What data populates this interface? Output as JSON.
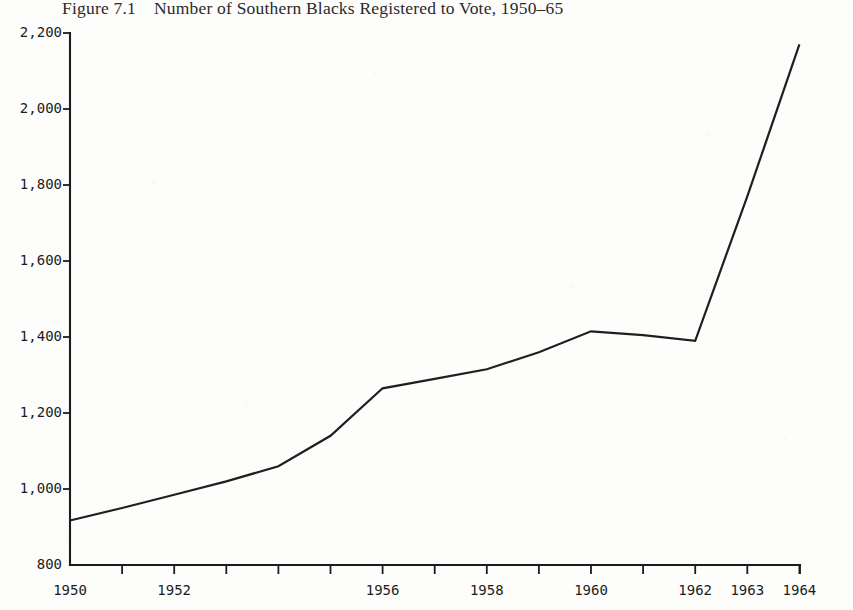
{
  "figure": {
    "number_label": "Figure 7.1",
    "caption": "Number of Southern Blacks Registered to Vote, 1950–65"
  },
  "chart_data": {
    "type": "line",
    "xlabel": "",
    "ylabel": "",
    "x": [
      1950,
      1951,
      1952,
      1953,
      1954,
      1955,
      1956,
      1957,
      1958,
      1959,
      1960,
      1961,
      1962,
      1963,
      1964
    ],
    "values": [
      917,
      950,
      985,
      1020,
      1060,
      1140,
      1265,
      1290,
      1315,
      1360,
      1415,
      1405,
      1390,
      1770,
      2170
    ],
    "series": [
      {
        "name": "Southern Blacks registered to vote (thousands)",
        "values": [
          917,
          950,
          985,
          1020,
          1060,
          1140,
          1265,
          1290,
          1315,
          1360,
          1415,
          1405,
          1390,
          1770,
          2170
        ]
      }
    ],
    "xlim": [
      1950,
      1964.85
    ],
    "ylim": [
      800,
      2200
    ],
    "ytick_values": [
      800,
      1000,
      1200,
      1400,
      1600,
      1800,
      2000,
      2200
    ],
    "ytick_labels": [
      "800",
      "1,000",
      "1,200",
      "1,400",
      "1,600",
      "1,800",
      "2,000",
      "2,200"
    ],
    "xtick_values": [
      1950,
      1951,
      1952,
      1953,
      1954,
      1955,
      1956,
      1957,
      1958,
      1959,
      1960,
      1961,
      1962,
      1963,
      1964
    ],
    "xtick_labels_shown": [
      {
        "value": 1950,
        "label": "1950"
      },
      {
        "value": 1952,
        "label": "1952"
      },
      {
        "value": 1956,
        "label": "1956"
      },
      {
        "value": 1958,
        "label": "1958"
      },
      {
        "value": 1960,
        "label": "1960"
      },
      {
        "value": 1962,
        "label": "1962"
      },
      {
        "value": 1963,
        "label": "1963"
      },
      {
        "value": 1964,
        "label": "1964"
      }
    ],
    "grid": false,
    "legend": null,
    "line_color": "#1f1f1f",
    "axis_color": "#1c1c1c",
    "background_color": "#fdfdfc"
  }
}
